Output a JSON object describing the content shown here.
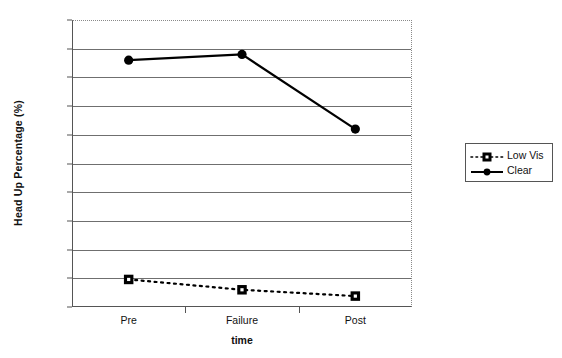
{
  "chart_data": {
    "type": "line",
    "title": "",
    "xlabel": "time",
    "ylabel": "Head Up Percentage (%)",
    "categories": [
      "Pre",
      "Failure",
      "Post"
    ],
    "series": [
      {
        "name": "Low Vis",
        "values": [
          4.8,
          3.0,
          1.9
        ],
        "marker": "square",
        "line_style": "dotted",
        "color": "#000000"
      },
      {
        "name": "Clear",
        "values": [
          43.0,
          44.0,
          31.0
        ],
        "marker": "circle",
        "line_style": "solid",
        "color": "#000000"
      }
    ],
    "ylim": [
      0,
      50
    ],
    "ytick_labels": [
      "0",
      "5",
      "10",
      "15",
      "20",
      "25",
      "30",
      "35",
      "40",
      "45",
      "50"
    ],
    "ytick_values": [
      0,
      5,
      10,
      15,
      20,
      25,
      30,
      35,
      40,
      45,
      50
    ],
    "grid": true,
    "grid_axis": "y",
    "legend_position": "right-outside"
  },
  "legend": {
    "entries": [
      {
        "label": "Low Vis"
      },
      {
        "label": "Clear"
      }
    ]
  },
  "axes": {
    "y_title": "Head Up Percentage (%)",
    "x_title": "time"
  }
}
